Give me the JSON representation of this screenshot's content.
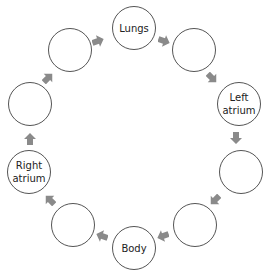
{
  "diagram": {
    "colors": {
      "circle_border": "#555555",
      "arrow": "#8a8a8a",
      "text": "#222222"
    },
    "nodes": [
      {
        "id": "lungs",
        "label": "Lungs",
        "cx": 134,
        "cy": 28
      },
      {
        "id": "blank-1",
        "label": "",
        "cx": 194,
        "cy": 50
      },
      {
        "id": "left-atrium",
        "label": "Left\natrium",
        "cx": 239,
        "cy": 104
      },
      {
        "id": "blank-2",
        "label": "",
        "cx": 241,
        "cy": 172
      },
      {
        "id": "blank-3",
        "label": "",
        "cx": 195,
        "cy": 225
      },
      {
        "id": "body",
        "label": "Body",
        "cx": 134,
        "cy": 248
      },
      {
        "id": "blank-4",
        "label": "",
        "cx": 73,
        "cy": 225
      },
      {
        "id": "right-atrium",
        "label": "Right\natrium",
        "cx": 29,
        "cy": 172
      },
      {
        "id": "blank-5",
        "label": "",
        "cx": 30,
        "cy": 104
      },
      {
        "id": "blank-6",
        "label": "",
        "cx": 70,
        "cy": 50
      }
    ],
    "arrows": [
      {
        "from": "lungs",
        "to": "blank-1",
        "x": 164,
        "y": 41,
        "angle": 20
      },
      {
        "from": "blank-1",
        "to": "left-atrium",
        "x": 212,
        "y": 78,
        "angle": 45
      },
      {
        "from": "left-atrium",
        "to": "blank-2",
        "x": 236,
        "y": 138,
        "angle": 90
      },
      {
        "from": "blank-2",
        "to": "blank-3",
        "x": 215,
        "y": 200,
        "angle": 135
      },
      {
        "from": "blank-3",
        "to": "body",
        "x": 163,
        "y": 236,
        "angle": 160
      },
      {
        "from": "body",
        "to": "blank-4",
        "x": 102,
        "y": 236,
        "angle": 200
      },
      {
        "from": "blank-4",
        "to": "right-atrium",
        "x": 50,
        "y": 200,
        "angle": 225
      },
      {
        "from": "right-atrium",
        "to": "blank-5",
        "x": 30,
        "y": 139,
        "angle": 270
      },
      {
        "from": "blank-5",
        "to": "blank-6",
        "x": 48,
        "y": 78,
        "angle": 315
      },
      {
        "from": "blank-6",
        "to": "lungs",
        "x": 98,
        "y": 41,
        "angle": 340
      }
    ]
  }
}
